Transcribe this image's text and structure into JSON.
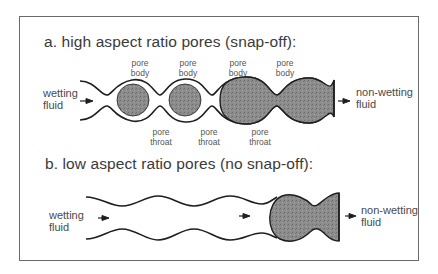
{
  "figure": {
    "panel_a": {
      "title": "a. high aspect ratio pores (snap-off):",
      "inlet_label": "wetting\nfluid",
      "outlet_label": "non-wetting\nfluid",
      "pore_body_labels": [
        "pore\nbody",
        "pore\nbody",
        "pore\nbody",
        "pore\nbody"
      ],
      "pore_throat_labels": [
        "pore\nthroat",
        "pore\nthroat",
        "pore\nthroat"
      ]
    },
    "panel_b": {
      "title": "b. low aspect ratio pores (no snap-off):",
      "inlet_label": "wetting\nfluid",
      "outlet_label": "non-wetting\nfluid"
    },
    "colors": {
      "line": "#1e1e1e",
      "fill": "#8a8a8a",
      "frame": "#6a6a6a"
    }
  }
}
